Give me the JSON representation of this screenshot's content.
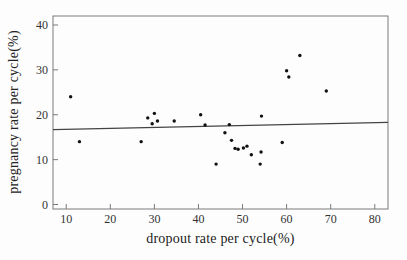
{
  "chart_data": {
    "type": "scatter",
    "title": "",
    "xlabel": "dropout rate per cycle(%)",
    "ylabel": "pregnancy rate per cycle(%)",
    "xlim": [
      7,
      83
    ],
    "ylim": [
      -1,
      42
    ],
    "x_ticks": [
      10,
      20,
      30,
      40,
      50,
      60,
      70,
      80
    ],
    "y_ticks": [
      0,
      10,
      20,
      30,
      40
    ],
    "grid": false,
    "legend": "none",
    "points": [
      [
        11,
        24
      ],
      [
        13,
        14
      ],
      [
        27,
        14
      ],
      [
        28.5,
        19.3
      ],
      [
        29.5,
        18
      ],
      [
        30,
        20.3
      ],
      [
        30.7,
        18.6
      ],
      [
        34.5,
        18.6
      ],
      [
        40.5,
        20
      ],
      [
        41.5,
        17.7
      ],
      [
        44,
        9
      ],
      [
        46,
        16
      ],
      [
        47,
        17.8
      ],
      [
        47.5,
        14.3
      ],
      [
        48.3,
        12.5
      ],
      [
        49,
        12.3
      ],
      [
        50.2,
        12.6
      ],
      [
        51,
        13
      ],
      [
        52,
        11.1
      ],
      [
        54,
        9
      ],
      [
        54.2,
        11.7
      ],
      [
        54.3,
        19.7
      ],
      [
        59,
        13.8
      ],
      [
        60,
        29.8
      ],
      [
        60.5,
        28.4
      ],
      [
        63,
        33.2
      ],
      [
        69,
        25.3
      ]
    ],
    "fit_line": {
      "x1": 7,
      "y1": 16.7,
      "x2": 83,
      "y2": 18.3
    },
    "point_color": "#111111",
    "line_color": "#444444",
    "frame_color": "#7a7a7a",
    "text_color": "#333333"
  }
}
